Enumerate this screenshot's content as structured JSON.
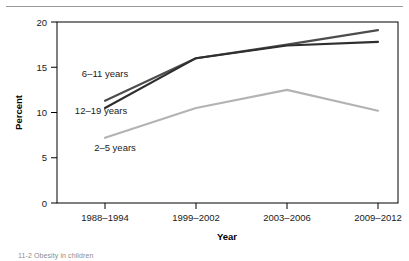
{
  "figure": {
    "caption": "11-2   Obesity in children"
  },
  "chart_data": {
    "type": "line",
    "title": "",
    "xlabel": "Year",
    "ylabel": "Percent",
    "categories": [
      "1988–1994",
      "1999–2002",
      "2003–2006",
      "2009–2012"
    ],
    "ylim": [
      0,
      20
    ],
    "yticks": [
      0,
      5,
      10,
      15,
      20
    ],
    "ytick_labels": [
      "0",
      "5",
      "10",
      "15",
      "20"
    ],
    "grid": false,
    "legend": "inline-labels",
    "series": [
      {
        "name": "6–11 years",
        "values": [
          11.3,
          16.0,
          17.5,
          19.1
        ],
        "color": "#4d4d4d",
        "label_x": 105,
        "label_y": 77
      },
      {
        "name": "12–19 years",
        "values": [
          10.5,
          16.0,
          17.4,
          17.8
        ],
        "color": "#2e2e2e",
        "label_x": 101,
        "label_y": 114
      },
      {
        "name": "2–5 years",
        "values": [
          7.2,
          10.5,
          12.5,
          10.2
        ],
        "color": "#b3b3b3",
        "label_x": 115,
        "label_y": 151
      }
    ]
  }
}
